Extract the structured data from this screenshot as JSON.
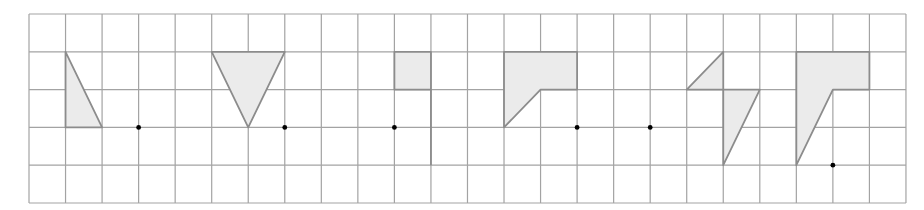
{
  "diagram": {
    "title": "",
    "grid": {
      "cols": 24,
      "rows": 5,
      "origin_x": 29,
      "origin_y": 14,
      "cell_w": 36.54,
      "cell_h": 37.8,
      "line_color": "#a3a3a3"
    },
    "style": {
      "fill": "#ebebeb",
      "stroke": "#8c8c8c",
      "dot_color": "#000000",
      "dot_radius": 2.4
    },
    "shapes": [
      {
        "name": "figure-1-right-triangle",
        "points": [
          [
            1,
            1
          ],
          [
            1,
            3
          ],
          [
            2,
            3
          ]
        ]
      },
      {
        "name": "figure-2-inverted-triangle",
        "points": [
          [
            5,
            1
          ],
          [
            7,
            1
          ],
          [
            6,
            3
          ]
        ]
      },
      {
        "name": "figure-3-square",
        "points": [
          [
            10,
            1
          ],
          [
            11,
            1
          ],
          [
            11,
            2
          ],
          [
            10,
            2
          ]
        ]
      },
      {
        "name": "figure-4-pentagon",
        "points": [
          [
            13,
            1
          ],
          [
            15,
            1
          ],
          [
            15,
            2
          ],
          [
            14,
            2
          ],
          [
            13,
            3
          ]
        ]
      },
      {
        "name": "figure-5a-small-triangle",
        "points": [
          [
            18,
            2
          ],
          [
            19,
            1
          ],
          [
            19,
            2
          ]
        ]
      },
      {
        "name": "figure-5b-long-triangle",
        "points": [
          [
            19,
            2
          ],
          [
            20,
            2
          ],
          [
            19,
            4
          ]
        ]
      },
      {
        "name": "figure-6-pentagon",
        "points": [
          [
            21,
            1
          ],
          [
            23,
            1
          ],
          [
            23,
            2
          ],
          [
            22,
            2
          ],
          [
            21,
            4
          ]
        ]
      }
    ],
    "segments": [
      {
        "name": "figure-3-edge-line",
        "from": [
          11,
          2
        ],
        "to": [
          11,
          4
        ]
      }
    ],
    "dots": [
      {
        "name": "rotation-center-1",
        "at": [
          3,
          3
        ]
      },
      {
        "name": "rotation-center-2",
        "at": [
          7,
          3
        ]
      },
      {
        "name": "rotation-center-3",
        "at": [
          10,
          3
        ]
      },
      {
        "name": "rotation-center-4",
        "at": [
          15,
          3
        ]
      },
      {
        "name": "rotation-center-5",
        "at": [
          17,
          3
        ]
      },
      {
        "name": "rotation-center-6",
        "at": [
          22,
          4
        ]
      }
    ]
  }
}
